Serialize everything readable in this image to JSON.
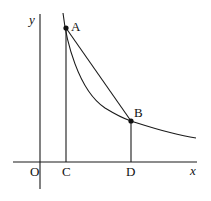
{
  "diagram": {
    "type": "hyperbola-with-chord",
    "axes": {
      "x_label": "x",
      "y_label": "y",
      "origin_label": "O"
    },
    "points": [
      {
        "name": "A",
        "label": "A",
        "on": "curve"
      },
      {
        "name": "B",
        "label": "B",
        "on": "curve"
      },
      {
        "name": "C",
        "label": "C",
        "on": "x-axis",
        "foot_of": "A"
      },
      {
        "name": "D",
        "label": "D",
        "on": "x-axis",
        "foot_of": "B"
      }
    ],
    "segments": [
      "AB",
      "AC",
      "BD"
    ],
    "curve": "y = k/x (x > 0)",
    "colors": {
      "stroke": "#1a1a1a",
      "background": "#ffffff"
    }
  }
}
